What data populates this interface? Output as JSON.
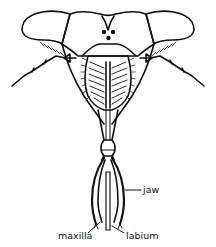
{
  "figure": {
    "colors": {
      "ink": "#111111",
      "background": "#ffffff"
    },
    "labels": [
      {
        "id": "jaw",
        "text": "jaw"
      },
      {
        "id": "maxilla",
        "text": "maxilla"
      },
      {
        "id": "labium",
        "text": "labium"
      }
    ]
  }
}
